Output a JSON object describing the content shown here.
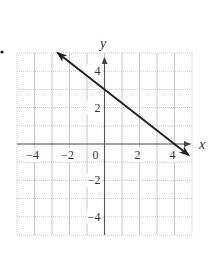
{
  "problem_marker": "•",
  "chart_data": {
    "type": "line",
    "title": "",
    "xlabel": "x",
    "ylabel": "y",
    "xlim": [
      -5,
      5
    ],
    "ylim": [
      -5,
      5
    ],
    "grid": true,
    "x_ticks": [
      -4,
      -2,
      0,
      2,
      4
    ],
    "y_ticks": [
      4,
      2,
      -2,
      -4
    ],
    "x_tick_labels": [
      "−4",
      "−2",
      "0",
      "2",
      "4"
    ],
    "y_tick_labels": [
      "4",
      "2",
      "−2",
      "−4"
    ],
    "series": [
      {
        "name": "line",
        "equation": "y = -3/4 x + 3",
        "slope": -0.75,
        "intercept": 3,
        "x": [
          -2.67,
          0,
          4,
          4.8
        ],
        "y": [
          5,
          3,
          0,
          -0.6
        ],
        "arrows": "both",
        "color": "#222222"
      }
    ]
  }
}
